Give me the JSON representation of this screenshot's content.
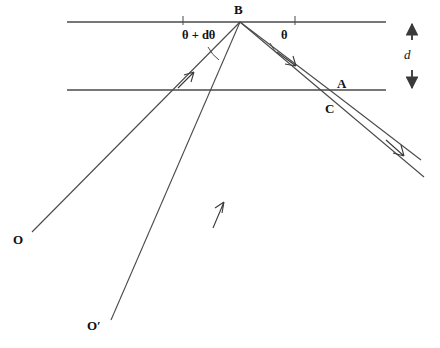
{
  "figure": {
    "background_color": "#ffffff",
    "stroke_color": "#3a3a3a",
    "text_color": "#111111",
    "width": 440,
    "height": 348
  },
  "labels": {
    "point_B": "B",
    "point_A": "A",
    "point_C": "C",
    "source_O": "O",
    "source_O_prime": "O′",
    "angle_theta": "θ",
    "angle_theta_plus_dtheta": "θ + dθ",
    "separation_d": "d"
  },
  "geometry": {
    "surface_top": {
      "name": "top-surface-line",
      "x1": 67,
      "y1": 22,
      "x2": 386,
      "y2": 22
    },
    "surface_bottom": {
      "name": "bottom-surface-line",
      "x1": 67,
      "y1": 90,
      "x2": 386,
      "y2": 90
    },
    "vertex_B": {
      "x": 240,
      "y": 22
    },
    "point_A": {
      "x": 331,
      "y": 91
    },
    "point_C": {
      "x": 324,
      "y": 104
    },
    "source_O": {
      "x": 32,
      "y": 232
    },
    "source_O_prime": {
      "x": 111,
      "y": 320
    },
    "ray_O_to_B": {
      "name": "incident-ray-from-O",
      "x1": 32,
      "y1": 232,
      "x2": 240,
      "y2": 22
    },
    "ray_B_to_A": {
      "name": "reflected-ray-B-to-A",
      "x1": 240,
      "y1": 22,
      "x2": 331,
      "y2": 91
    },
    "ray_A_exit": {
      "name": "exit-ray-from-A",
      "x1": 331,
      "y1": 91,
      "x2": 420,
      "y2": 159
    },
    "ray_Oprime_to_B": {
      "name": "incident-ray-from-O-prime",
      "x1": 111,
      "y1": 320,
      "x2": 240,
      "y2": 22
    },
    "ray_B_to_C_exit": {
      "name": "exit-ray-through-C",
      "x1": 240,
      "y1": 22,
      "x2": 420,
      "y2": 174
    },
    "tick_left": {
      "x": 183,
      "y": 22
    },
    "tick_right": {
      "x": 295,
      "y": 22
    },
    "arrowheads": [
      {
        "name": "arrowhead-on-incident-ray-O",
        "x": 192,
        "y": 74,
        "angle": -45
      },
      {
        "name": "arrowhead-on-incident-ray-O-prime",
        "x": 222,
        "y": 207,
        "angle": -66
      },
      {
        "name": "arrowhead-on-reflected-ray-BA",
        "x": 293,
        "y": 63,
        "angle": 37
      },
      {
        "name": "arrowhead-on-exit-ray",
        "x": 400,
        "y": 153,
        "angle": 40
      }
    ],
    "separation_marker": {
      "x": 412,
      "y_top": 22,
      "y_bottom": 90,
      "label_y": 56
    }
  },
  "label_positions": {
    "B": {
      "x": 234,
      "y": 4
    },
    "A": {
      "x": 337,
      "y": 78
    },
    "C": {
      "x": 325,
      "y": 102
    },
    "O": {
      "x": 14,
      "y": 234
    },
    "O_prime": {
      "x": 88,
      "y": 320
    },
    "theta": {
      "x": 282,
      "y": 30
    },
    "theta_plus_dtheta": {
      "x": 183,
      "y": 30
    },
    "d": {
      "x": 405,
      "y": 49
    }
  }
}
